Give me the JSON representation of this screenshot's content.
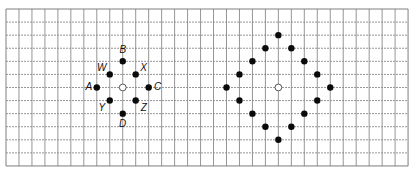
{
  "grid": {
    "origin_x": 6,
    "origin_y": 9,
    "cell_w": 12.97,
    "cell_h": 13.08,
    "cols": 31,
    "rows": 12,
    "line_color": "#8a8a8a",
    "border_color": "#6f6f6f"
  },
  "left_figure": {
    "center": {
      "col": 9,
      "row": 6
    },
    "points": [
      {
        "label": "B",
        "dc": 0,
        "dr": -2,
        "lx": 0,
        "ly": -11
      },
      {
        "label": "W",
        "dc": -1,
        "dr": -1,
        "lx": -8,
        "ly": -6
      },
      {
        "label": "X",
        "dc": 1,
        "dr": -1,
        "lx": 8,
        "ly": -6
      },
      {
        "label": "A",
        "dc": -2,
        "dr": 0,
        "lx": -8,
        "ly": 0
      },
      {
        "label": "C",
        "dc": 2,
        "dr": 0,
        "lx": 9,
        "ly": 0
      },
      {
        "label": "Y",
        "dc": -1,
        "dr": 1,
        "lx": -8,
        "ly": 7
      },
      {
        "label": "Z",
        "dc": 1,
        "dr": 1,
        "lx": 8,
        "ly": 7
      },
      {
        "label": "D",
        "dc": 0,
        "dr": 2,
        "lx": 0,
        "ly": 10
      }
    ]
  },
  "right_figure": {
    "center": {
      "col": 21,
      "row": 6
    },
    "points": [
      {
        "dc": 0,
        "dr": -4
      },
      {
        "dc": -1,
        "dr": -3
      },
      {
        "dc": 1,
        "dr": -3
      },
      {
        "dc": -2,
        "dr": -2
      },
      {
        "dc": 2,
        "dr": -2
      },
      {
        "dc": -3,
        "dr": -1
      },
      {
        "dc": 3,
        "dr": -1
      },
      {
        "dc": -4,
        "dr": 0
      },
      {
        "dc": 4,
        "dr": 0
      },
      {
        "dc": -3,
        "dr": 1
      },
      {
        "dc": 3,
        "dr": 1
      },
      {
        "dc": -2,
        "dr": 2
      },
      {
        "dc": 2,
        "dr": 2
      },
      {
        "dc": -1,
        "dr": 3
      },
      {
        "dc": 1,
        "dr": 3
      },
      {
        "dc": 0,
        "dr": 4
      }
    ]
  },
  "labels": {
    "B": "B",
    "W": "W",
    "X": "X",
    "A": "A",
    "C": "C",
    "Y": "Y",
    "Z": "Z",
    "D": "D"
  }
}
